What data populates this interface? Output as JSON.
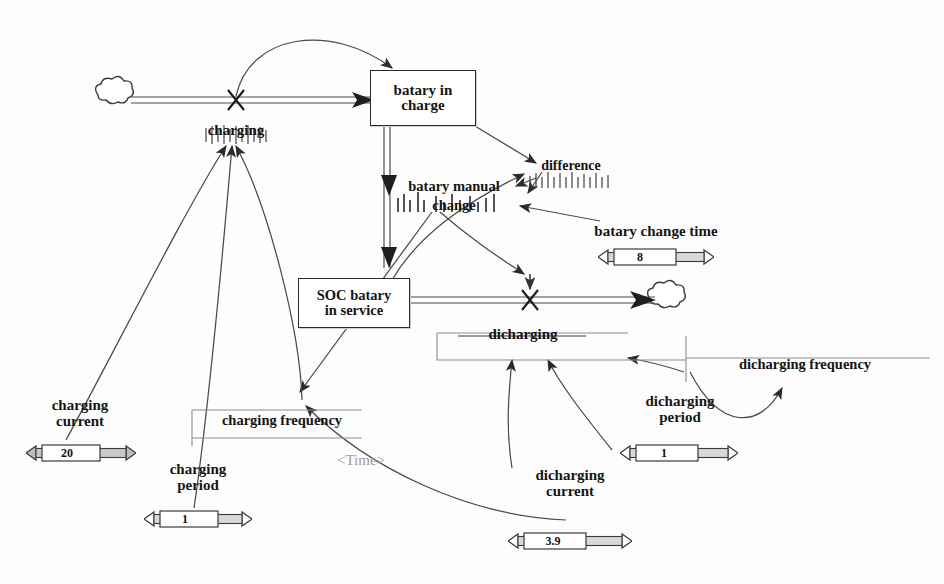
{
  "diagram": {
    "type": "stock-and-flow",
    "title": "",
    "background_color": "#fdfdfd",
    "line_color": "#4a4a4a",
    "text_color": "#141414",
    "time_label": "<Time>"
  },
  "stocks": [
    {
      "id": "batary_in_charge",
      "label_line1": "batary in",
      "label_line2": "charge"
    },
    {
      "id": "soc_batary_in_service",
      "label_line1": "SOC batary",
      "label_line2": "in service"
    }
  ],
  "flows": [
    {
      "id": "charging",
      "label": "charging"
    },
    {
      "id": "dicharging",
      "label": "dicharging"
    }
  ],
  "auxiliaries": [
    {
      "id": "batary_manual_change",
      "label_line1": "batary manual",
      "label_line2": "change"
    },
    {
      "id": "difference",
      "label": "difference"
    },
    {
      "id": "charging_frequency",
      "label": "charging frequency"
    },
    {
      "id": "dicharging_frequency",
      "label": "dicharging frequency"
    }
  ],
  "sliders": [
    {
      "id": "charging_current",
      "label_line1": "charging",
      "label_line2": "current",
      "value": "20",
      "handle_position": 0.52
    },
    {
      "id": "charging_period",
      "label_line1": "charging",
      "label_line2": "period",
      "value": "1",
      "handle_position": 0.5
    },
    {
      "id": "batary_change_time",
      "label_line1": "batary change time",
      "label_line2": "",
      "value": "8",
      "handle_position": 0.5
    },
    {
      "id": "dicharging_period",
      "label_line1": "dicharging",
      "label_line2": "period",
      "value": "1",
      "handle_position": 0.5
    },
    {
      "id": "dicharging_current",
      "label_line1": "dicharging",
      "label_line2": "current",
      "value": "3.9",
      "handle_position": 0.52
    }
  ],
  "clouds": [
    {
      "id": "source_cloud",
      "name": "source-cloud"
    },
    {
      "id": "sink_cloud",
      "name": "sink-cloud"
    }
  ]
}
